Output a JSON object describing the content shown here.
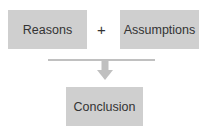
{
  "diagram": {
    "inputs": [
      {
        "label": "Reasons"
      },
      {
        "label": "Assumptions"
      }
    ],
    "operator": "+",
    "output": {
      "label": "Conclusion"
    },
    "colors": {
      "box_fill": "#cfcfcf",
      "connector": "#c0c0c0",
      "text": "#333333"
    }
  }
}
